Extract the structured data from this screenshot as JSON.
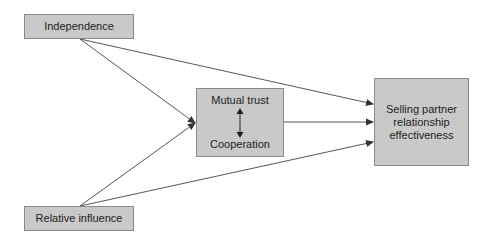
{
  "diagram": {
    "nodes": {
      "independence": {
        "label": "Independence"
      },
      "relative_influence": {
        "label": "Relative influence"
      },
      "mediator": {
        "top_label": "Mutual trust",
        "bottom_label": "Cooperation"
      },
      "outcome": {
        "label": "Selling partner relationship effectiveness"
      }
    },
    "edges": [
      {
        "from": "Independence",
        "to": "Mutual trust / Cooperation"
      },
      {
        "from": "Independence",
        "to": "Selling partner relationship effectiveness"
      },
      {
        "from": "Relative influence",
        "to": "Mutual trust / Cooperation"
      },
      {
        "from": "Relative influence",
        "to": "Selling partner relationship effectiveness"
      },
      {
        "from": "Mutual trust / Cooperation",
        "to": "Selling partner relationship effectiveness"
      },
      {
        "from": "Mutual trust",
        "to": "Cooperation",
        "bidirectional": true
      }
    ],
    "colors": {
      "box_fill": "#c9c9c9",
      "box_border": "#8a8a8a",
      "line": "#333333"
    }
  }
}
